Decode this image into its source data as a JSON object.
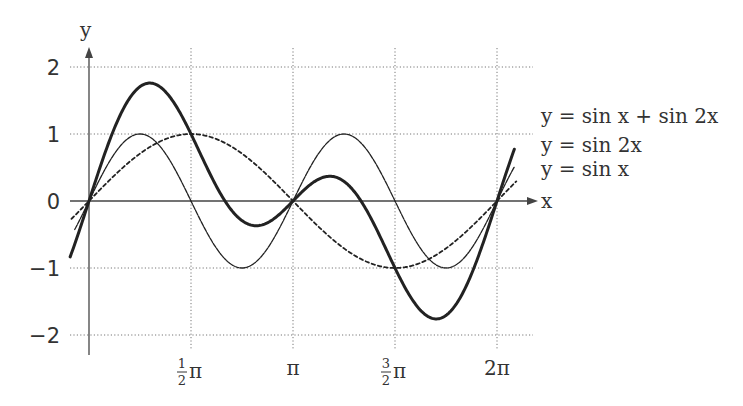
{
  "chart_data": {
    "type": "line",
    "title": "",
    "xlabel": "x",
    "ylabel": "y",
    "xlim": [
      -0.29,
      6.58
    ],
    "ylim": [
      -2,
      2
    ],
    "grid": true,
    "legend_position": "inline-right",
    "x_ticks": [
      {
        "value": 1.5708,
        "label_num": "1",
        "label_den": "2",
        "label_sym": "π",
        "fraction": true
      },
      {
        "value": 3.1416,
        "label": "π",
        "fraction": false
      },
      {
        "value": 4.7124,
        "label_num": "3",
        "label_den": "2",
        "label_sym": "π",
        "fraction": true
      },
      {
        "value": 6.2832,
        "label": "2π",
        "fraction": false
      }
    ],
    "y_ticks": [
      {
        "value": 2,
        "label": "2"
      },
      {
        "value": 1,
        "label": "1"
      },
      {
        "value": 0,
        "label": "0"
      },
      {
        "value": -1,
        "label": "−1"
      },
      {
        "value": -2,
        "label": "−2"
      }
    ],
    "series": [
      {
        "name": "y = sin x + sin 2x",
        "function": "sin(x)+sin(2x)",
        "style": "solid-thick",
        "x": [
          0,
          0.9359,
          1.5708,
          2.2,
          3.1416,
          3.6,
          4.7124,
          5.3473,
          6.2832
        ],
        "values": [
          0,
          1.76,
          1.0,
          -0.14,
          0,
          0.37,
          -1.0,
          -1.76,
          0
        ]
      },
      {
        "name": "y = sin 2x",
        "function": "sin(2x)",
        "style": "solid-thin",
        "x": [
          0,
          0.7854,
          1.5708,
          2.3562,
          3.1416,
          3.927,
          4.7124,
          5.4978,
          6.2832
        ],
        "values": [
          0,
          1,
          0,
          -1,
          0,
          1,
          0,
          -1,
          0
        ]
      },
      {
        "name": "y = sin x",
        "function": "sin(x)",
        "style": "dashed",
        "x": [
          0,
          1.5708,
          3.1416,
          4.7124,
          6.2832
        ],
        "values": [
          0,
          1,
          0,
          -1,
          0
        ]
      }
    ]
  },
  "axes": {
    "x_label": "x",
    "y_label": "y"
  },
  "legend": {
    "items": [
      {
        "label": "y = sin x + sin 2x"
      },
      {
        "label": "y = sin 2x"
      },
      {
        "label": "y = sin x"
      }
    ]
  },
  "style": {
    "curve_color": "#222222",
    "grid_color": "#777777",
    "axis_color": "#444444"
  }
}
